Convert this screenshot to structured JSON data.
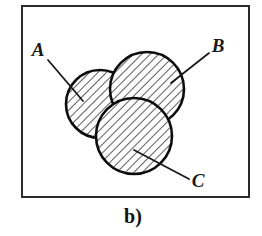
{
  "figure": {
    "caption": "b)",
    "frame": {
      "x": 21,
      "y": 5,
      "width": 229,
      "height": 193,
      "stroke_color": "#2b2b2b",
      "stroke_width": 2,
      "fill_color": "#ffffff"
    },
    "hatch": {
      "angle_degrees": 45,
      "spacing_px": 6,
      "line_width": 1.4,
      "color": "#1a1a1a"
    },
    "circles": [
      {
        "id": "A",
        "label": "A",
        "cx": 100,
        "cy": 104,
        "r": 34,
        "filled": "hatched",
        "stroke_color": "#0d0d0d",
        "stroke_width": 2.6
      },
      {
        "id": "B",
        "label": "B",
        "cx": 147,
        "cy": 89,
        "r": 37,
        "filled": "hatched",
        "stroke_color": "#0d0d0d",
        "stroke_width": 2.6
      },
      {
        "id": "C",
        "label": "C",
        "cx": 134,
        "cy": 136,
        "r": 38,
        "filled": "hatched",
        "stroke_color": "#0d0d0d",
        "stroke_width": 2.6
      }
    ],
    "labels": [
      {
        "id": "A",
        "text": "A",
        "x": 38,
        "y": 56,
        "leader_x1": 48,
        "leader_y1": 60,
        "leader_x2": 83,
        "leader_y2": 101
      },
      {
        "id": "B",
        "text": "B",
        "x": 212,
        "y": 52,
        "leader_x1": 209,
        "leader_y1": 53,
        "leader_x2": 171,
        "leader_y2": 83
      },
      {
        "id": "C",
        "text": "C",
        "x": 191,
        "y": 187,
        "leader_x1": 189,
        "leader_y1": 179,
        "leader_x2": 134,
        "leader_y2": 150
      }
    ],
    "leader_line": {
      "color": "#1a1a1a",
      "width": 1.8
    },
    "caption_position": {
      "x": 133,
      "y": 223
    }
  }
}
